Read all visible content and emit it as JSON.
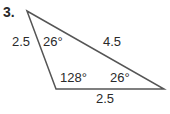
{
  "problem": {
    "number": "3."
  },
  "triangle": {
    "sides": {
      "left": "2.5",
      "hypotenuse": "4.5",
      "bottom": "2.5"
    },
    "angles": {
      "top": "26°",
      "bottom_left": "128°",
      "right": "26°"
    },
    "stroke_color": "#555555"
  }
}
